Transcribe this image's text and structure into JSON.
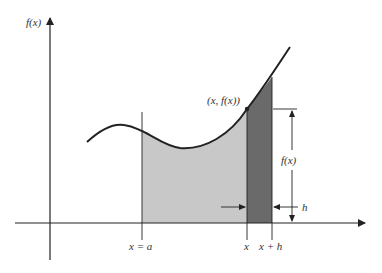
{
  "diagram": {
    "type": "area-under-curve",
    "labels": {
      "y_axis": "f(x)",
      "point": "(x, f(x))",
      "left_bound": "x = a",
      "x_tick": "x",
      "x_plus_h_tick": "x + h",
      "height_dim": "f(x)",
      "width_dim": "h"
    },
    "colors": {
      "ink": "#222222",
      "light_region": "#c8c8c8",
      "dark_strip": "#6a6a6a",
      "background": "#ffffff"
    }
  }
}
